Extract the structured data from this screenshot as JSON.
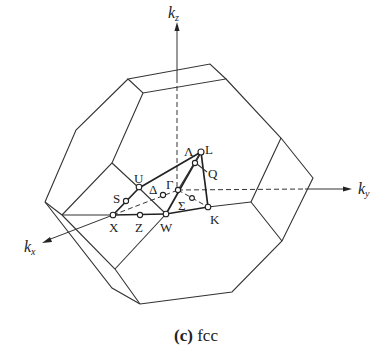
{
  "figure": {
    "caption_letter": "(c)",
    "caption_text": "fcc"
  },
  "axes": {
    "kx": {
      "base": "k",
      "sub": "x"
    },
    "ky": {
      "base": "k",
      "sub": "y"
    },
    "kz": {
      "base": "k",
      "sub": "z"
    }
  },
  "points": {
    "gamma": "Γ",
    "L": "L",
    "X": "X",
    "W": "W",
    "K": "K",
    "U": "U",
    "S": "S",
    "Z": "Z",
    "Q": "Q",
    "delta": "Δ",
    "lambda": "Λ",
    "sigma": "Σ"
  }
}
